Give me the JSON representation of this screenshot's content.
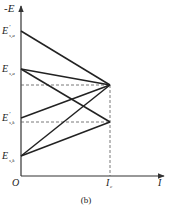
{
  "diagram": {
    "y_axis_label": "-E",
    "x_axis_label": "I",
    "origin_label": "O",
    "x_tick_label": "I",
    "x_tick_sub": "c",
    "caption": "(b)",
    "levels": [
      {
        "name": "E'_{s,a}",
        "main": "E",
        "prime": "'",
        "sub": "s,a",
        "y": 31
      },
      {
        "name": "E_{s,a}",
        "main": "E",
        "prime": "",
        "sub": "s,a",
        "y": 69
      },
      {
        "name": "E'_{s,k}",
        "main": "E",
        "prime": "'",
        "sub": "s,k",
        "y": 118
      },
      {
        "name": "E_{s,k}",
        "main": "E",
        "prime": "",
        "sub": "s,k",
        "y": 156
      }
    ],
    "convergence_points": [
      {
        "label": "upper",
        "x": 110,
        "y": 85
      },
      {
        "label": "lower",
        "x": 110,
        "y": 122
      }
    ],
    "lines": [
      {
        "from": "E'_{s,a}",
        "to": "upper"
      },
      {
        "from": "E_{s,a}",
        "to": "upper"
      },
      {
        "from": "E_{s,a}",
        "to": "lower"
      },
      {
        "from": "E'_{s,k}",
        "to": "upper"
      },
      {
        "from": "E_{s,k}",
        "to": "upper"
      },
      {
        "from": "E_{s,k}",
        "to": "lower"
      }
    ]
  }
}
